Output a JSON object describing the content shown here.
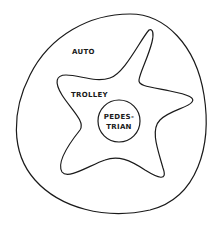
{
  "diagram": {
    "type": "nested-zones",
    "zones": [
      {
        "name": "auto",
        "label": "AUTO",
        "shape": "rounded-blob"
      },
      {
        "name": "trolley",
        "label": "TROLLEY",
        "shape": "star-blob"
      },
      {
        "name": "pedestrian",
        "label_line1": "PEDES-",
        "label_line2": "TRIAN",
        "shape": "circle"
      }
    ],
    "stroke_color": "#1a1a1a",
    "background": "#ffffff"
  }
}
